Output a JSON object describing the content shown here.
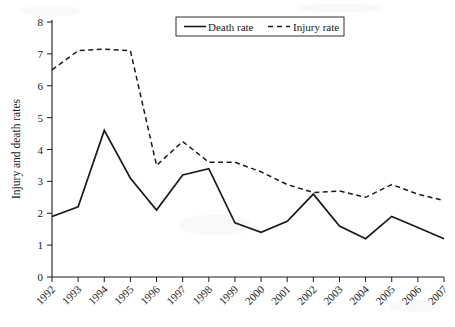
{
  "figure": {
    "background_color": "#ffffff",
    "ink_color": "#1a1a1a",
    "ylabel": "Injury and death rates"
  },
  "legend": {
    "position": "top-center",
    "entries": [
      {
        "label": "Death rate",
        "style": "solid"
      },
      {
        "label": "Injury rate",
        "style": "dashed"
      }
    ]
  },
  "axes": {
    "y_ticks": [
      "0",
      "1",
      "2",
      "3",
      "4",
      "5",
      "6",
      "7",
      "8"
    ],
    "x_ticks": [
      "1992",
      "1993",
      "1994",
      "1995",
      "1996",
      "1997",
      "1998",
      "1999",
      "2000",
      "2001",
      "2002",
      "2003",
      "2004",
      "2005",
      "2006",
      "2007"
    ]
  },
  "chart_data": {
    "type": "line",
    "title": "",
    "xlabel": "",
    "ylabel": "Injury and death rates",
    "categories": [
      "1992",
      "1993",
      "1994",
      "1995",
      "1996",
      "1997",
      "1998",
      "1999",
      "2000",
      "2001",
      "2002",
      "2003",
      "2004",
      "2005",
      "2006",
      "2007"
    ],
    "x": [
      1992,
      1993,
      1994,
      1995,
      1996,
      1997,
      1998,
      1999,
      2000,
      2001,
      2002,
      2003,
      2004,
      2005,
      2006,
      2007
    ],
    "ylim": [
      0,
      8
    ],
    "ytick_step": 1,
    "grid": false,
    "legend_position": "top-center",
    "series": [
      {
        "name": "Death rate",
        "style": "solid",
        "color": "#1a1a1a",
        "values": [
          1.9,
          2.2,
          4.6,
          3.1,
          2.1,
          3.2,
          3.4,
          1.7,
          1.4,
          1.75,
          2.6,
          1.6,
          1.2,
          1.9,
          1.55,
          1.2
        ]
      },
      {
        "name": "Injury rate",
        "style": "dashed",
        "color": "#1a1a1a",
        "values": [
          6.5,
          7.1,
          7.15,
          7.1,
          3.5,
          4.25,
          3.6,
          3.6,
          3.3,
          2.9,
          2.65,
          2.7,
          2.5,
          2.9,
          2.6,
          2.4
        ]
      }
    ]
  }
}
